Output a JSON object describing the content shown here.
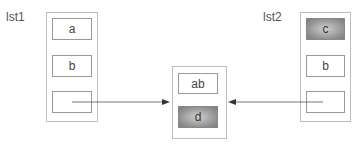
{
  "lists": {
    "lst1": {
      "label": "lst1",
      "cells": [
        "a",
        "b",
        ""
      ]
    },
    "lst2": {
      "label": "lst2",
      "cells": [
        "c",
        "b",
        ""
      ]
    }
  },
  "center": {
    "cells": [
      "ab",
      "d"
    ]
  },
  "shaded_cells": [
    "lst2.cells.0",
    "center.cells.1"
  ],
  "colors": {
    "line": "#555555",
    "border": "#9a9a9a",
    "shade": "#8a8a8a"
  }
}
